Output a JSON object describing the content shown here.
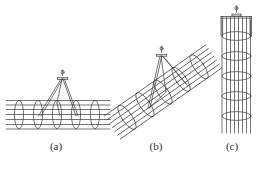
{
  "figure": {
    "background_color": "#ffffff",
    "line_color": "#3a3a3a",
    "width": 264,
    "height": 169,
    "captions": {
      "a": "(a)",
      "b": "(b)",
      "c": "(c)"
    },
    "panels": [
      {
        "key": "a",
        "label": "(a)",
        "description": "Horizontal rebar cage lifted by a two-leg sling from a single hook",
        "orientation": "horizontal",
        "stirrup_count": 5,
        "stirrup_shape": "ellipse",
        "longitudinal_bar_count": 7,
        "sling_legs": 2,
        "hook_count": 1,
        "hook_position": {
          "x": 62,
          "y": 74
        }
      },
      {
        "key": "b",
        "label": "(b)",
        "description": "Inclined rebar cage lifted by a two-leg sling of unequal length",
        "orientation": "inclined",
        "incline_angle_deg": 35,
        "stirrup_count": 5,
        "stirrup_shape": "ellipse",
        "longitudinal_bar_count": 7,
        "sling_legs": 2,
        "hook_count": 1,
        "hook_position": {
          "x": 161,
          "y": 51
        }
      },
      {
        "key": "c",
        "label": "(c)",
        "description": "Vertical column rebar cage lifted with a spreader frame and single hook",
        "orientation": "vertical",
        "hoop_count": 5,
        "hoop_shape": "ellipse",
        "vertical_bar_count": 8,
        "spreader_frame": true,
        "hook_count": 1,
        "hook_position": {
          "x": 238,
          "y": 9
        }
      }
    ]
  }
}
